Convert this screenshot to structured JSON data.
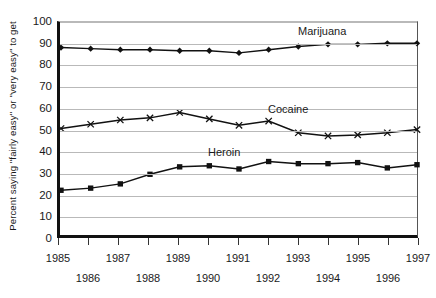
{
  "chart_data": {
    "type": "line",
    "title": "",
    "xlabel": "",
    "ylabel": "Percent saying \"fairly easy\" or \"very easy\" to get",
    "ylim": [
      0,
      100
    ],
    "ytick_labels": [
      "100",
      "90",
      "80",
      "70",
      "60",
      "50",
      "40",
      "30",
      "20",
      "10",
      "0"
    ],
    "ytick_values": [
      100,
      90,
      80,
      70,
      60,
      50,
      40,
      30,
      20,
      10,
      0
    ],
    "grid": true,
    "legend_position": "inline-labels",
    "x": [
      1985,
      1986,
      1987,
      1988,
      1989,
      1990,
      1991,
      1992,
      1993,
      1994,
      1995,
      1996,
      1997
    ],
    "xtick_labels": [
      "1985",
      "1986",
      "1987",
      "1988",
      "1989",
      "1990",
      "1991",
      "1992",
      "1993",
      "1994",
      "1995",
      "1996",
      "1997"
    ],
    "xtick_rows": [
      1,
      2,
      1,
      2,
      1,
      2,
      1,
      2,
      1,
      2,
      1,
      2,
      1
    ],
    "series": [
      {
        "name": "Marijuana",
        "marker": "diamond",
        "color": "#111111",
        "values": [
          88,
          87.5,
          87,
          87,
          86.5,
          86.5,
          85.5,
          87,
          88.5,
          89.5,
          89.5,
          90,
          90
        ]
      },
      {
        "name": "Cocaine",
        "marker": "cross",
        "color": "#111111",
        "values": [
          50,
          52,
          54,
          55,
          57.5,
          54.5,
          51.5,
          53.5,
          48,
          46.5,
          47,
          48,
          49.5
        ]
      },
      {
        "name": "Heroin",
        "marker": "square",
        "color": "#111111",
        "values": [
          21,
          22,
          24,
          28.5,
          32,
          32.5,
          31,
          34.5,
          33.5,
          33.5,
          34,
          31.5,
          33
        ]
      }
    ],
    "annotations": [
      {
        "text": "Marijuana",
        "x": 1993,
        "y": 95
      },
      {
        "text": "Cocaine",
        "x": 1992,
        "y": 59
      },
      {
        "text": "Heroin",
        "x": 1990,
        "y": 39
      }
    ]
  }
}
